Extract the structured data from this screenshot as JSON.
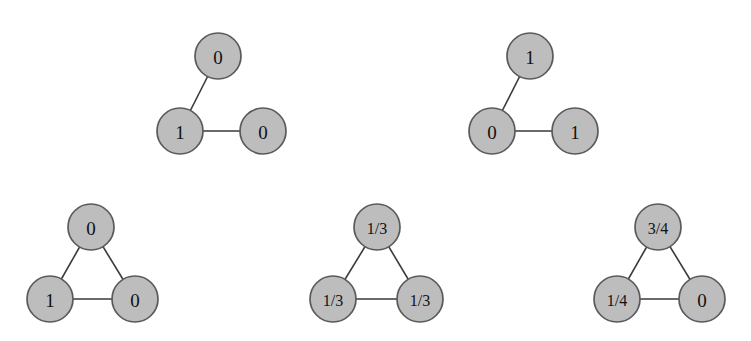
{
  "figure": {
    "background_color": "#ffffff",
    "node_fill_color": "#bdbdbd",
    "node_stroke_color": "#5a5a5a",
    "edge_color": "#3a3a3a",
    "label_color": "#111111",
    "graphs": [
      {
        "id": "graph-top-left",
        "layout": "path-three-nodes",
        "nodes": [
          {
            "id": "g1-top",
            "label": "0",
            "cx": 218,
            "cy": 56,
            "r": 23
          },
          {
            "id": "g1-left",
            "label": "1",
            "cx": 180,
            "cy": 131,
            "r": 23
          },
          {
            "id": "g1-right",
            "label": "0",
            "cx": 263,
            "cy": 131,
            "r": 23
          }
        ],
        "edges": [
          {
            "from": "g1-left",
            "to": "g1-top"
          },
          {
            "from": "g1-left",
            "to": "g1-right"
          }
        ]
      },
      {
        "id": "graph-top-right",
        "layout": "path-three-nodes",
        "nodes": [
          {
            "id": "g2-top",
            "label": "1",
            "cx": 530,
            "cy": 56,
            "r": 23
          },
          {
            "id": "g2-left",
            "label": "0",
            "cx": 492,
            "cy": 131,
            "r": 23
          },
          {
            "id": "g2-right",
            "label": "1",
            "cx": 575,
            "cy": 131,
            "r": 23
          }
        ],
        "edges": [
          {
            "from": "g2-left",
            "to": "g2-top"
          },
          {
            "from": "g2-left",
            "to": "g2-right"
          }
        ]
      },
      {
        "id": "graph-bottom-left",
        "layout": "triangle-three-nodes",
        "nodes": [
          {
            "id": "g3-top",
            "label": "0",
            "cx": 91,
            "cy": 227,
            "r": 23
          },
          {
            "id": "g3-left",
            "label": "1",
            "cx": 50,
            "cy": 299,
            "r": 23
          },
          {
            "id": "g3-right",
            "label": "0",
            "cx": 135,
            "cy": 299,
            "r": 23
          }
        ],
        "edges": [
          {
            "from": "g3-left",
            "to": "g3-top"
          },
          {
            "from": "g3-top",
            "to": "g3-right"
          },
          {
            "from": "g3-left",
            "to": "g3-right"
          }
        ]
      },
      {
        "id": "graph-bottom-middle",
        "layout": "triangle-three-nodes",
        "nodes": [
          {
            "id": "g4-top",
            "label": "1/3",
            "cx": 377,
            "cy": 227,
            "r": 23
          },
          {
            "id": "g4-left",
            "label": "1/3",
            "cx": 333,
            "cy": 299,
            "r": 23
          },
          {
            "id": "g4-right",
            "label": "1/3",
            "cx": 420,
            "cy": 299,
            "r": 23
          }
        ],
        "edges": [
          {
            "from": "g4-left",
            "to": "g4-top"
          },
          {
            "from": "g4-top",
            "to": "g4-right"
          },
          {
            "from": "g4-left",
            "to": "g4-right"
          }
        ]
      },
      {
        "id": "graph-bottom-right",
        "layout": "triangle-three-nodes",
        "nodes": [
          {
            "id": "g5-top",
            "label": "3/4",
            "cx": 658,
            "cy": 227,
            "r": 23
          },
          {
            "id": "g5-left",
            "label": "1/4",
            "cx": 617,
            "cy": 299,
            "r": 23
          },
          {
            "id": "g5-right",
            "label": "0",
            "cx": 702,
            "cy": 299,
            "r": 23
          }
        ],
        "edges": [
          {
            "from": "g5-left",
            "to": "g5-top"
          },
          {
            "from": "g5-top",
            "to": "g5-right"
          },
          {
            "from": "g5-left",
            "to": "g5-right"
          }
        ]
      }
    ]
  }
}
